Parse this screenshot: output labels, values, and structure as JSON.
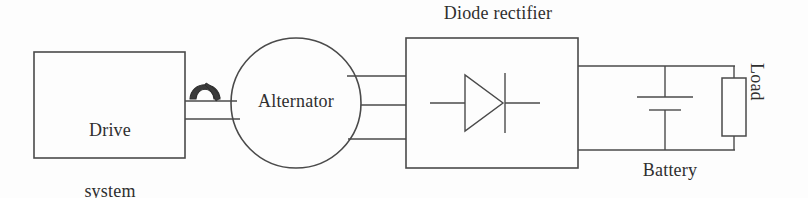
{
  "diagram": {
    "background_color": "#fdfdfd",
    "line_color": "#4a4a4a",
    "text_color": "#2f2f2f",
    "blocks": [
      {
        "id": "drive-system",
        "label": "Drive\nsystem",
        "label_line1": "Drive",
        "label_line2": "system",
        "shape": "rectangle",
        "x": 34,
        "y": 52,
        "width": 151,
        "height": 106
      },
      {
        "id": "alternator",
        "label": "Alternator",
        "shape": "circle",
        "cx": 296,
        "cy": 103,
        "r": 65
      },
      {
        "id": "diode-rectifier",
        "label": "Diode rectifier",
        "shape": "rectangle",
        "x": 406,
        "y": 38,
        "width": 172,
        "height": 130
      },
      {
        "id": "load",
        "label": "Load",
        "shape": "resistor-rectangle",
        "x": 722,
        "y": 78,
        "width": 24,
        "height": 58
      }
    ],
    "components": [
      {
        "id": "shaft-coupling",
        "label": "",
        "type": "mechanical-coupling",
        "x": 189,
        "y": 79
      },
      {
        "id": "battery",
        "label": "Battery",
        "type": "battery-cell",
        "x": 665,
        "y": 103
      },
      {
        "id": "diode",
        "label": "",
        "type": "diode-symbol",
        "x": 492,
        "y": 103
      }
    ],
    "connections": [
      {
        "id": "shaft-line-upper",
        "from": "drive-system",
        "to": "alternator",
        "kind": "shaft"
      },
      {
        "id": "shaft-line-lower",
        "from": "drive-system",
        "to": "alternator",
        "kind": "shaft"
      },
      {
        "id": "phase-a",
        "from": "alternator",
        "to": "diode-rectifier",
        "kind": "ac-phase"
      },
      {
        "id": "phase-b",
        "from": "alternator",
        "to": "diode-rectifier",
        "kind": "ac-phase"
      },
      {
        "id": "phase-c",
        "from": "alternator",
        "to": "diode-rectifier",
        "kind": "ac-phase"
      },
      {
        "id": "dc-positive",
        "from": "diode-rectifier",
        "to": "load",
        "kind": "dc-rail"
      },
      {
        "id": "dc-negative",
        "from": "diode-rectifier",
        "to": "load",
        "kind": "dc-rail"
      }
    ]
  },
  "labels": {
    "drive_system_line1": "Drive",
    "drive_system_line2": "system",
    "alternator": "Alternator",
    "diode_rectifier": "Diode rectifier",
    "battery": "Battery",
    "load": "Load"
  }
}
